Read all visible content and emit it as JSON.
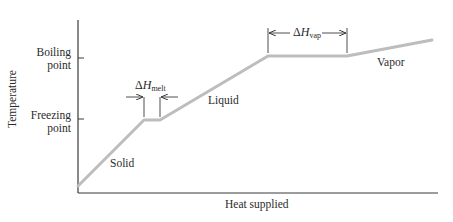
{
  "axes": {
    "x_label": "Heat supplied",
    "y_label": "Temperature",
    "y_ticks": [
      {
        "line1": "Boiling",
        "line2": "point"
      },
      {
        "line1": "Freezing",
        "line2": "point"
      }
    ]
  },
  "regions": {
    "solid": "Solid",
    "liquid": "Liquid",
    "vapor": "Vapor"
  },
  "annotations": {
    "melt": {
      "delta": "ΔH",
      "sub": "melt"
    },
    "vap": {
      "delta": "ΔH",
      "sub": "vap"
    }
  },
  "colors": {
    "curve": "#bdbdbd",
    "axis": "#3a3a3a",
    "text": "#2a2a2a"
  },
  "chart_data": {
    "type": "line",
    "title": "",
    "xlabel": "Heat supplied",
    "ylabel": "Temperature",
    "segments": [
      {
        "phase": "Solid",
        "from": [
          0,
          0
        ],
        "to": [
          1,
          1
        ]
      },
      {
        "phase": "Melting (ΔH_melt)",
        "from": [
          1,
          1
        ],
        "to": [
          1.25,
          1
        ]
      },
      {
        "phase": "Liquid",
        "from": [
          1.25,
          1
        ],
        "to": [
          2.9,
          2
        ]
      },
      {
        "phase": "Boiling (ΔH_vap)",
        "from": [
          2.9,
          2
        ],
        "to": [
          4.1,
          2
        ]
      },
      {
        "phase": "Vapor",
        "from": [
          4.1,
          2
        ],
        "to": [
          5.4,
          2.25
        ]
      }
    ],
    "y_tick_labels": [
      "Freezing point",
      "Boiling point"
    ],
    "grid": false
  }
}
